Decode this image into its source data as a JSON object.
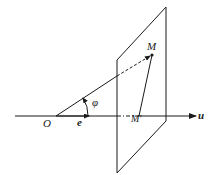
{
  "diagram": {
    "type": "vector projection onto axis",
    "labels": {
      "origin": "O",
      "unit_vector": "e",
      "angle": "φ",
      "point": "M",
      "projection": "M'",
      "axis": "u"
    },
    "colors": {
      "stroke": "#1a1a1a",
      "background": "#ffffff"
    }
  }
}
